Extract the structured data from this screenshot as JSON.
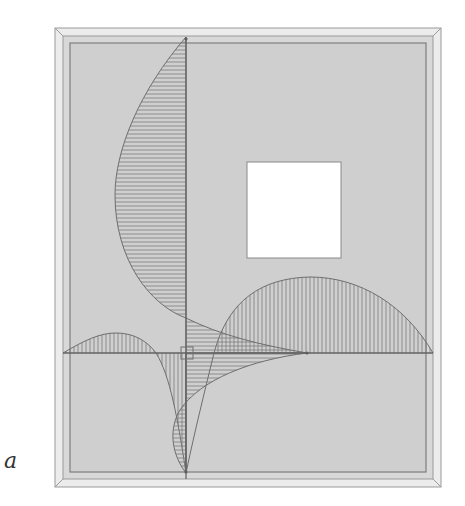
{
  "figure": {
    "panel_label": "a",
    "colors": {
      "panel_fill": "#cfcfcf",
      "frame_bevel": "#e6e6e6",
      "frame_line": "#8a8a8a",
      "curve_stroke": "#6e6e6e",
      "hatch": "#7a7a7a",
      "window_fill": "#ffffff",
      "page_bg": "#ffffff"
    }
  }
}
